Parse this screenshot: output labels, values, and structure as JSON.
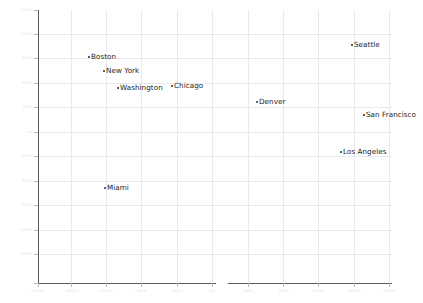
{
  "figure": {
    "width": 423,
    "height": 303,
    "background": "#ffffff",
    "grid_color": "#e9e9ec",
    "spine_color": "#5b5b5f",
    "marker_color": "#2b2b2b",
    "label_color": "#1a1a1a",
    "tick_label_color": "#e2e2e5"
  },
  "chart_data": {
    "type": "scatter",
    "title": "",
    "xlabel": "",
    "ylabel": "",
    "grid": true,
    "legend": "none",
    "xlim": [
      -2000.0,
      2000.0
    ],
    "ylim": [
      -1500.0,
      1500.0
    ],
    "xticks": [
      -2000.0,
      -1600.0,
      -1200.0,
      -800.0,
      -400.0,
      0.0,
      400.0,
      800.0,
      1200.0,
      1600.0,
      2000.0
    ],
    "xticklabels": [
      "-2000.0",
      "-1600.0",
      "-1200.0",
      "-800.0",
      "-400.0",
      "0.0",
      "400.0",
      "800.0",
      "1200.0",
      "1600.0",
      "2000.0"
    ],
    "yticks": [
      1500.0,
      1200.0,
      900.0,
      600.0,
      300.0,
      0.0,
      -300.0,
      -600.0,
      -900.0,
      -1200.0,
      -1500.0
    ],
    "yticklabels": [
      "1500.0",
      "1200.0",
      "900.0",
      "600.0",
      "300.0",
      "0.0",
      "-300.0",
      "-600.0",
      "-900.0",
      "-1200.0",
      "-1500.0"
    ],
    "points": [
      {
        "label": "Boston",
        "px": 89,
        "py": 57,
        "x": -1424,
        "y": 733
      },
      {
        "label": "New York",
        "px": 104,
        "py": 71,
        "x": -1254,
        "y": 579
      },
      {
        "label": "Washington",
        "px": 118,
        "py": 88,
        "x": -1096,
        "y": 392
      },
      {
        "label": "Chicago",
        "px": 172,
        "py": 86,
        "x": -486,
        "y": 414
      },
      {
        "label": "Denver",
        "px": 257,
        "py": 102,
        "x": 474,
        "y": 239
      },
      {
        "label": "Seattle",
        "px": 352,
        "py": 45,
        "x": 1548,
        "y": 865
      },
      {
        "label": "San Francisco",
        "px": 364,
        "py": 115,
        "x": 1684,
        "y": 96
      },
      {
        "label": "Los Angeles",
        "px": 341,
        "py": 152,
        "x": 1424,
        "y": -310
      },
      {
        "label": "Miami",
        "px": 105,
        "py": 188,
        "x": -1243,
        "y": -706
      }
    ]
  },
  "axes": {
    "plot_left": 38,
    "plot_top": 10,
    "plot_width": 354,
    "plot_height": 273,
    "bottom_spine_segments": [
      {
        "left": 38,
        "width": 178
      },
      {
        "left": 228,
        "width": 164
      }
    ],
    "vertical_gridlines_px": [
      71,
      106,
      141,
      177,
      212,
      248,
      283,
      318,
      354,
      389
    ],
    "horizontal_gridlines_px": [
      34,
      58,
      83,
      107,
      132,
      156,
      181,
      205,
      230,
      254
    ],
    "x_tick_px": [
      38,
      71,
      106,
      141,
      177,
      212,
      248,
      283,
      318,
      354,
      389
    ],
    "y_tick_px": [
      10,
      34,
      58,
      83,
      107,
      132,
      156,
      181,
      205,
      230,
      254,
      283
    ]
  }
}
